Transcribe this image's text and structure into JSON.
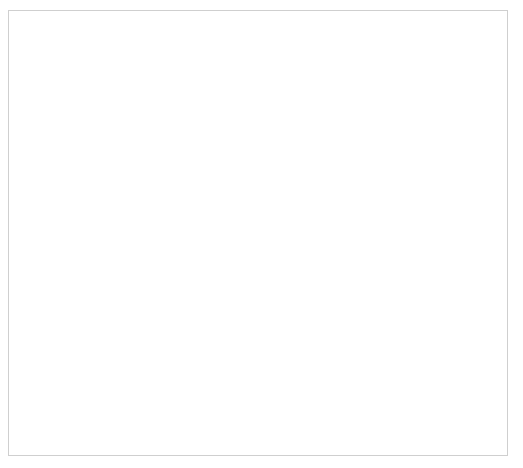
{
  "diagram": {
    "style": {
      "box_fill": "#d9d9d9",
      "box_border": "#5a5a5a",
      "dashed_border": "#3a3a3a",
      "strong_border": "#000000",
      "line_color": "#3a3a3a",
      "frame_border": "#cfcfcf",
      "background": "#ffffff"
    },
    "nodes": [
      {
        "id": "manual_pressure",
        "label": "Manual pressure",
        "x": 236,
        "y": 20,
        "w": 120,
        "h": 22,
        "variant": "solid"
      },
      {
        "id": "lidocaine",
        "label": "Lidocaine with epinephrine",
        "x": 219,
        "y": 63,
        "w": 154,
        "h": 22,
        "variant": "solid"
      },
      {
        "id": "nasal_speculum",
        "label": "Nasal speculum",
        "x": 236,
        "y": 106,
        "w": 120,
        "h": 22,
        "variant": "solid"
      },
      {
        "id": "anterior_source",
        "label": "Anterior source",
        "x": 113,
        "y": 155,
        "w": 116,
        "h": 24,
        "variant": "strong"
      },
      {
        "id": "posterior_source",
        "label": "Posterior source",
        "x": 353,
        "y": 155,
        "w": 128,
        "h": 24,
        "variant": "strong"
      },
      {
        "id": "source_visualized",
        "label": "Source visualized",
        "x": 22,
        "y": 202,
        "w": 116,
        "h": 21,
        "variant": "dashed"
      },
      {
        "id": "source_not_visualized",
        "label": "Source not visualized",
        "x": 190,
        "y": 202,
        "w": 126,
        "h": 21,
        "variant": "dashed"
      },
      {
        "id": "posterior_packing",
        "label": "Posterior packing",
        "x": 358,
        "y": 202,
        "w": 130,
        "h": 21,
        "variant": "solid"
      },
      {
        "id": "cauterization",
        "label": "Cauterizaton",
        "x": 22,
        "y": 240,
        "w": 116,
        "h": 21,
        "variant": "solid"
      },
      {
        "id": "anterior_packing_1",
        "label": "Anterior packing",
        "x": 214,
        "y": 240,
        "w": 106,
        "h": 21,
        "variant": "solid"
      },
      {
        "id": "rolled_gauze",
        "label": "Rolled gauze method",
        "x": 374,
        "y": 237,
        "w": 114,
        "h": 20,
        "variant": "solid"
      },
      {
        "id": "merocel",
        "label": "Merocel tampon",
        "x": 222,
        "y": 273,
        "w": 98,
        "h": 20,
        "variant": "solid"
      },
      {
        "id": "epistat",
        "label": "Epistat device",
        "x": 374,
        "y": 267,
        "w": 114,
        "h": 20,
        "variant": "solid"
      },
      {
        "id": "bleeding_persists_1",
        "label": "Bleeding persists",
        "x": 22,
        "y": 278,
        "w": 116,
        "h": 21,
        "variant": "dashed"
      },
      {
        "id": "xeroform",
        "label": "Xeroform gauze",
        "x": 222,
        "y": 305,
        "w": 98,
        "h": 20,
        "variant": "solid"
      },
      {
        "id": "foley",
        "label": "Foley catheter",
        "x": 374,
        "y": 297,
        "w": 114,
        "h": 20,
        "variant": "solid"
      },
      {
        "id": "anterior_packing_2",
        "label": "Anterior packing",
        "x": 358,
        "y": 343,
        "w": 130,
        "h": 21,
        "variant": "solid"
      },
      {
        "id": "bleeding_persists_2",
        "label": "Bleeding persists",
        "x": 205,
        "y": 344,
        "w": 118,
        "h": 21,
        "variant": "dashed"
      },
      {
        "id": "pack_contralateral",
        "label": "Pack contralateral nares",
        "x": 205,
        "y": 380,
        "w": 118,
        "h": 30,
        "variant": "solid"
      },
      {
        "id": "bleeding_persists_3",
        "label": "Bleeding persists",
        "x": 205,
        "y": 424,
        "w": 118,
        "h": 21,
        "variant": "dashed"
      }
    ],
    "edges": [
      {
        "id": "e-manual-lidocaine",
        "type": "arrow-down",
        "from": "manual_pressure",
        "to": "lidocaine"
      },
      {
        "id": "e-lidocaine-speculum",
        "type": "arrow-down",
        "from": "lidocaine",
        "to": "nasal_speculum"
      },
      {
        "id": "e-speculum-split",
        "type": "split",
        "from": "nasal_speculum",
        "to": [
          "anterior_source",
          "posterior_source"
        ]
      },
      {
        "id": "e-anterior-split",
        "type": "split",
        "from": "anterior_source",
        "to": [
          "source_visualized",
          "source_not_visualized"
        ]
      },
      {
        "id": "e-visualized-cautery",
        "type": "arrow-down",
        "from": "source_visualized",
        "to": "cauterization"
      },
      {
        "id": "e-cautery-bleeding",
        "type": "arrow-down",
        "from": "cauterization",
        "to": "bleeding_persists_1"
      },
      {
        "id": "e-notvis-antpack",
        "type": "arrow-down",
        "from": "source_not_visualized",
        "to": "anterior_packing_1"
      },
      {
        "id": "e-bleeding1-antpack",
        "type": "elbow-right-up",
        "from": "bleeding_persists_1",
        "to": "anterior_packing_1"
      },
      {
        "id": "e-antpack-merocel",
        "type": "hook",
        "from": "anterior_packing_1",
        "to": "merocel"
      },
      {
        "id": "e-antpack-xeroform",
        "type": "hook",
        "from": "anterior_packing_1",
        "to": "xeroform"
      },
      {
        "id": "e-xeroform-bleeding2",
        "type": "arrow-down",
        "from": "xeroform",
        "to": "bleeding_persists_2"
      },
      {
        "id": "e-bleeding2-packcontra",
        "type": "arrow-down",
        "from": "bleeding_persists_2",
        "to": "pack_contralateral"
      },
      {
        "id": "e-packcontra-bleeding3",
        "type": "arrow-down",
        "from": "pack_contralateral",
        "to": "bleeding_persists_3"
      },
      {
        "id": "e-bleeding3-postpack",
        "type": "elbow-right-up",
        "from": "bleeding_persists_3",
        "to": "posterior_packing"
      },
      {
        "id": "e-posterior-postpack",
        "type": "arrow-down",
        "from": "posterior_source",
        "to": "posterior_packing"
      },
      {
        "id": "e-postpack-rolled",
        "type": "hook",
        "from": "posterior_packing",
        "to": "rolled_gauze"
      },
      {
        "id": "e-postpack-epistat",
        "type": "hook",
        "from": "posterior_packing",
        "to": "epistat"
      },
      {
        "id": "e-postpack-foley",
        "type": "hook",
        "from": "posterior_packing",
        "to": "foley"
      },
      {
        "id": "e-foley-antpack2",
        "type": "arrow-down",
        "from": "foley",
        "to": "anterior_packing_2"
      }
    ]
  }
}
